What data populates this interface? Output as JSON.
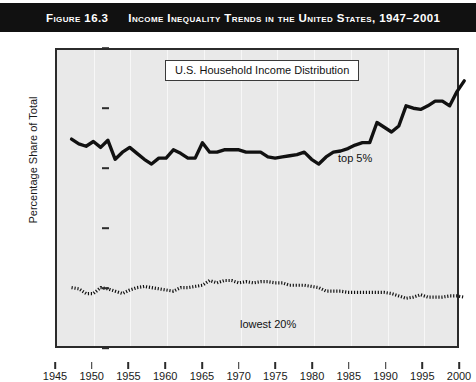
{
  "banner": {
    "figure_label": "Figure 16.3",
    "title": "Income Inequality Trends in the United States, 1947–2001",
    "background_color": "#111111",
    "text_color": "#ffffff"
  },
  "legend": {
    "box_label": "U.S. Household Income Distribution"
  },
  "annotations": {
    "top5": "top 5%",
    "lowest20": "lowest 20%"
  },
  "bottom_sliver": {
    "text": ""
  },
  "chart_data": {
    "type": "line",
    "title": "U.S. Household Income Distribution",
    "xlabel": "",
    "ylabel": "Percentage Share of Total",
    "xlim": [
      1945,
      2000
    ],
    "ylim": [
      0,
      25
    ],
    "xticks": [
      1945,
      1950,
      1955,
      1960,
      1965,
      1970,
      1975,
      1980,
      1985,
      1990,
      1995,
      2000
    ],
    "yticks": [
      0,
      5,
      10,
      15,
      20,
      25
    ],
    "grid": "vertical",
    "legend_position": "top-center",
    "plot_background": "#e9e9e9",
    "line_color": "#111111",
    "series": [
      {
        "name": "top 5%",
        "style": "solid",
        "x": [
          1947,
          1948,
          1949,
          1950,
          1951,
          1952,
          1953,
          1954,
          1955,
          1956,
          1957,
          1958,
          1959,
          1960,
          1961,
          1962,
          1963,
          1964,
          1965,
          1966,
          1967,
          1968,
          1969,
          1970,
          1971,
          1972,
          1973,
          1974,
          1975,
          1976,
          1977,
          1978,
          1979,
          1980,
          1981,
          1982,
          1983,
          1984,
          1985,
          1986,
          1987,
          1988,
          1989,
          1990,
          1991,
          1992,
          1993,
          1994,
          1995,
          1996,
          1997,
          1998,
          1999,
          2000,
          2001
        ],
        "values": [
          17.5,
          17.1,
          16.9,
          17.3,
          16.8,
          17.4,
          15.8,
          16.4,
          16.8,
          16.3,
          15.8,
          15.4,
          15.9,
          15.9,
          16.6,
          16.3,
          15.9,
          15.9,
          17.2,
          16.4,
          16.4,
          16.6,
          16.6,
          16.6,
          16.4,
          16.4,
          16.4,
          16.0,
          15.9,
          16.0,
          16.1,
          16.2,
          16.4,
          15.8,
          15.4,
          16.0,
          16.4,
          16.5,
          16.7,
          17.0,
          17.2,
          17.2,
          18.9,
          18.5,
          18.1,
          18.6,
          20.3,
          20.1,
          20.0,
          20.3,
          20.7,
          20.7,
          20.3,
          21.5,
          22.4
        ]
      },
      {
        "name": "lowest 20%",
        "style": "dashed",
        "x": [
          1947,
          1948,
          1949,
          1950,
          1951,
          1952,
          1953,
          1954,
          1955,
          1956,
          1957,
          1958,
          1959,
          1960,
          1961,
          1962,
          1963,
          1964,
          1965,
          1966,
          1967,
          1968,
          1969,
          1970,
          1971,
          1972,
          1973,
          1974,
          1975,
          1976,
          1977,
          1978,
          1979,
          1980,
          1981,
          1982,
          1983,
          1984,
          1985,
          1986,
          1987,
          1988,
          1989,
          1990,
          1991,
          1992,
          1993,
          1994,
          1995,
          1996,
          1997,
          1998,
          1999,
          2000,
          2001
        ],
        "values": [
          5.0,
          4.9,
          4.5,
          4.5,
          5.0,
          4.9,
          4.7,
          4.5,
          4.8,
          5.0,
          5.1,
          5.0,
          4.9,
          4.8,
          4.7,
          5.0,
          5.0,
          5.1,
          5.2,
          5.6,
          5.4,
          5.6,
          5.6,
          5.4,
          5.5,
          5.4,
          5.5,
          5.5,
          5.4,
          5.4,
          5.2,
          5.2,
          5.2,
          5.1,
          5.0,
          4.7,
          4.7,
          4.7,
          4.6,
          4.6,
          4.6,
          4.6,
          4.6,
          4.6,
          4.5,
          4.3,
          4.1,
          4.2,
          4.4,
          4.2,
          4.2,
          4.2,
          4.3,
          4.3,
          4.2
        ]
      }
    ]
  }
}
